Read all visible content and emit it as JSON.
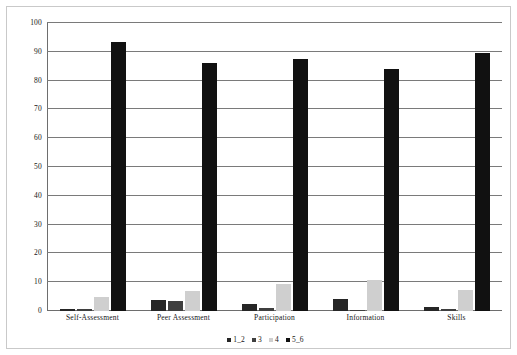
{
  "chart_data": {
    "type": "bar",
    "title": "",
    "subtitle": "",
    "xlabel": "",
    "ylabel": "",
    "ylim": [
      0,
      100
    ],
    "yticks": [
      0,
      10,
      20,
      30,
      40,
      50,
      60,
      70,
      80,
      90,
      100
    ],
    "ytick_labels": [
      "0",
      "10",
      "20",
      "30",
      "40",
      "50",
      "60",
      "70",
      "80",
      "90",
      "100"
    ],
    "grid": true,
    "grid_axis": "y",
    "legend_position": "bottom-center",
    "orientation": "vertical",
    "grouping": "clustered",
    "categories": [
      "Self-Assessment",
      "Peer Assessment",
      "Participation",
      "Information",
      "Skills"
    ],
    "series": [
      {
        "name": "1_2",
        "color": "#262626",
        "values": [
          0.7,
          3.9,
          2.5,
          4.3,
          1.4
        ]
      },
      {
        "name": "3",
        "color": "#3f3f3f",
        "values": [
          0.7,
          3.6,
          0.9,
          0.3,
          0.6
        ]
      },
      {
        "name": "4",
        "color": "#cfcfcf",
        "values": [
          4.8,
          6.9,
          9.3,
          10.8,
          7.2
        ]
      },
      {
        "name": "5_6",
        "color": "#111111",
        "values": [
          93.5,
          86.0,
          87.5,
          84.0,
          89.5
        ]
      }
    ]
  },
  "figure": {
    "background_color": "#ffffff",
    "frame_color": "#c9c9c9",
    "gridline_color": "#7a7a7a",
    "axis_color": "#6e6e6e",
    "text_color": "#151515"
  }
}
